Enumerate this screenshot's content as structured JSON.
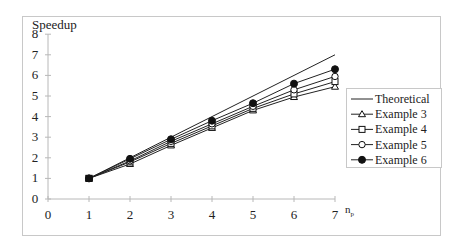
{
  "chart_data": {
    "type": "line",
    "title": "",
    "ylabel": "Speedup",
    "xlabel": "n_p",
    "xlabel_main": "n",
    "xlabel_sub": "p",
    "xlim": [
      0,
      7
    ],
    "ylim": [
      0,
      8
    ],
    "x_ticks": [
      "0",
      "1",
      "2",
      "3",
      "4",
      "5",
      "6",
      "7"
    ],
    "y_ticks": [
      "0",
      "1",
      "2",
      "3",
      "4",
      "5",
      "6",
      "7",
      "8"
    ],
    "grid": false,
    "legend_position": "right",
    "x": [
      1,
      2,
      3,
      4,
      5,
      6,
      7
    ],
    "series": [
      {
        "name": "Theoretical",
        "marker": "none",
        "values": [
          1,
          2,
          3,
          4,
          5,
          6,
          7
        ]
      },
      {
        "name": "Example 3",
        "marker": "triangle-open",
        "values": [
          1,
          1.7,
          2.6,
          3.45,
          4.3,
          4.95,
          5.45
        ]
      },
      {
        "name": "Example 4",
        "marker": "square-open",
        "values": [
          1,
          1.8,
          2.7,
          3.55,
          4.4,
          5.1,
          5.7
        ]
      },
      {
        "name": "Example 5",
        "marker": "circle-open",
        "values": [
          1,
          1.85,
          2.8,
          3.65,
          4.5,
          5.3,
          5.95
        ]
      },
      {
        "name": "Example 6",
        "marker": "circle-filled",
        "values": [
          1,
          1.95,
          2.9,
          3.8,
          4.65,
          5.6,
          6.3
        ]
      }
    ]
  }
}
